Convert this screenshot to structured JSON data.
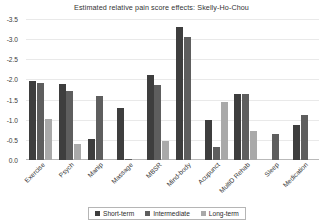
{
  "chart_data": {
    "type": "bar",
    "title": "Estimated relative pain score effects: Skelly-Ho-Chou",
    "xlabel": "",
    "ylabel": "",
    "ylim": [
      0.0,
      -3.5
    ],
    "yticks": [
      "0.0",
      "-0.5",
      "-1.0",
      "-1.5",
      "-2.0",
      "-2.5",
      "-3.0",
      "-3.5"
    ],
    "ytick_values": [
      0.0,
      -0.5,
      -1.0,
      -1.5,
      -2.0,
      -2.5,
      -3.0,
      -3.5
    ],
    "grid": true,
    "legend_position": "bottom",
    "categories": [
      "Exercise",
      "Psych",
      "Manip",
      "Massage",
      "MBSR",
      "Mind-body",
      "Acupunct",
      "MultiD Rehab",
      "Sleep",
      "Medication"
    ],
    "series": [
      {
        "name": "Short-term",
        "color": "#3e3e3e",
        "values": [
          -1.95,
          -1.88,
          -0.52,
          -1.3,
          -2.1,
          -3.3,
          -1.0,
          -1.65,
          null,
          -0.88
        ]
      },
      {
        "name": "Intermediate",
        "color": "#5e5e5e",
        "values": [
          -1.9,
          -1.72,
          -1.58,
          -0.03,
          -1.85,
          -3.05,
          -0.32,
          -1.63,
          -0.65,
          -1.12
        ]
      },
      {
        "name": "Long-term",
        "color": "#a9a9a9",
        "values": [
          -1.03,
          -0.4,
          null,
          null,
          -0.47,
          null,
          -1.45,
          -0.73,
          null,
          null
        ]
      }
    ]
  },
  "legend": {
    "entries": [
      {
        "label": "Short-term",
        "color": "#3e3e3e"
      },
      {
        "label": "Intermediate",
        "color": "#5e5e5e"
      },
      {
        "label": "Long-term",
        "color": "#a9a9a9"
      }
    ]
  }
}
